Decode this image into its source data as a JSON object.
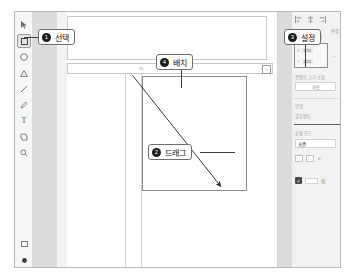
{
  "app": {
    "title": "Graphic Editor Tutorial"
  },
  "toolbar": {
    "items": [
      {
        "name": "pointer-tool",
        "icon": "cursor-arrow-icon",
        "selected": false
      },
      {
        "name": "rectangle-tool",
        "icon": "square-icon",
        "selected": true
      },
      {
        "name": "ellipse-tool",
        "icon": "circle-icon",
        "selected": false
      },
      {
        "name": "polygon-tool",
        "icon": "triangle-icon",
        "selected": false
      },
      {
        "name": "line-tool",
        "icon": "line-icon",
        "selected": false
      },
      {
        "name": "pen-tool",
        "icon": "pen-icon",
        "selected": false
      },
      {
        "name": "text-tool",
        "icon": "text-t-icon",
        "selected": false
      },
      {
        "name": "frame-tool",
        "icon": "frame-icon",
        "selected": false
      },
      {
        "name": "zoom-tool",
        "icon": "magnifier-icon",
        "selected": false
      }
    ],
    "bottom": [
      {
        "name": "artboard-tool",
        "icon": "square-outline-icon"
      },
      {
        "name": "color-tool",
        "icon": "filled-circle-icon"
      }
    ]
  },
  "canvas": {
    "ruler_tick": "90",
    "handle_icon": "resize-handle-icon"
  },
  "panel": {
    "align_icons": [
      "align-left-icon",
      "align-center-icon",
      "align-right-icon"
    ],
    "tab_label": "편집",
    "position": {
      "x_key": "X",
      "x_value": "170",
      "y_key": "Y",
      "y_value": "220",
      "link_icon": "link-ratio-icon"
    },
    "auto_section_label": "컨텐츠 크기 조정",
    "auto_button_label": "자동",
    "style_label": "모양",
    "style_sub_label": "불투명도",
    "blend_label": "혼합 모드",
    "blend_value": "표준",
    "swatch_count": "0",
    "bottom_checkbox_label": "획"
  },
  "callouts": [
    {
      "number": "1",
      "label": "선택",
      "name": "callout-select"
    },
    {
      "number": "2",
      "label": "드래그",
      "name": "callout-drag"
    },
    {
      "number": "3",
      "label": "설정",
      "name": "callout-settings"
    },
    {
      "number": "4",
      "label": "배치",
      "name": "callout-arrange"
    }
  ],
  "colors": {
    "window_border": "#b9b9b9",
    "panel_bg": "#f2f2f2",
    "band": "#dcdcdc",
    "callout_border": "#6e6e6e",
    "badge_bg": "#1c1c1c"
  }
}
